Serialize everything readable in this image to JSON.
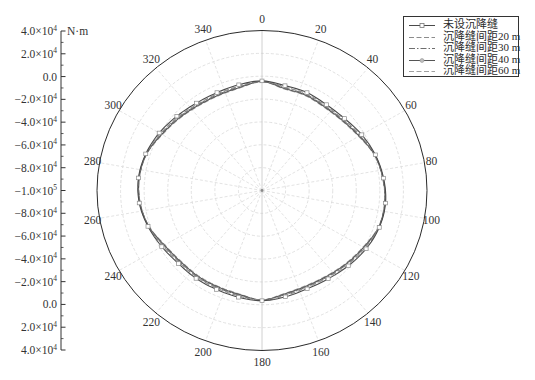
{
  "chart_data": {
    "type": "polar_line",
    "title": "",
    "grid": true,
    "legend_position": "top-right",
    "radial_axis": {
      "label": "N·m",
      "min": -100000,
      "max": 40000,
      "major_step": 20000,
      "tick_labels": [
        {
          "base": "4.0×10",
          "exp": "4"
        },
        {
          "base": "2.0×10",
          "exp": "4"
        },
        {
          "base": "0.0",
          "exp": ""
        },
        {
          "base": "−2.0×10",
          "exp": "4"
        },
        {
          "base": "−4.0×10",
          "exp": "4"
        },
        {
          "base": "−6.0×10",
          "exp": "4"
        },
        {
          "base": "−8.0×10",
          "exp": "4"
        },
        {
          "base": "−1.0×10",
          "exp": "5"
        },
        {
          "base": "−8.0×10",
          "exp": "4"
        },
        {
          "base": "−6.0×10",
          "exp": "4"
        },
        {
          "base": "−4.0×10",
          "exp": "4"
        },
        {
          "base": "−2.0×10",
          "exp": "4"
        },
        {
          "base": "0.0",
          "exp": ""
        },
        {
          "base": "2.0×10",
          "exp": "4"
        },
        {
          "base": "4.0×10",
          "exp": "4"
        }
      ]
    },
    "angular_axis": {
      "zero": "top",
      "direction": "clockwise",
      "tick_labels": [
        "0",
        "20",
        "40",
        "60",
        "80",
        "100",
        "120",
        "140",
        "160",
        "180",
        "200",
        "220",
        "240",
        "260",
        "280",
        "300",
        "320",
        "340"
      ]
    },
    "theta": [
      0,
      12,
      24,
      36,
      48,
      60,
      72,
      84,
      96,
      108,
      120,
      132,
      144,
      156,
      168,
      180,
      192,
      204,
      216,
      228,
      240,
      252,
      264,
      276,
      288,
      300,
      312,
      324,
      336,
      348
    ],
    "series": [
      {
        "name": "未设沉降缝",
        "color": "#4a4a4a",
        "line_style": "solid",
        "marker": "square",
        "values": [
          -4100,
          -6200,
          -6200,
          -7100,
          -5800,
          -2300,
          1100,
          3700,
          5400,
          4600,
          2000,
          -1500,
          -4500,
          -5800,
          -4900,
          -3600,
          -4500,
          -5200,
          -4900,
          -4500,
          -1800,
          1700,
          4700,
          5400,
          3700,
          700,
          -2800,
          -5400,
          -6200,
          -5400
        ]
      },
      {
        "name": "沉降缝间距20 m",
        "color": "#8c8c8c",
        "line_style": "dashed",
        "marker": "none",
        "values": [
          -4400,
          -7400,
          -7400,
          -8300,
          -7000,
          -3500,
          800,
          3400,
          5100,
          4300,
          800,
          -2700,
          -5700,
          -7000,
          -6100,
          -3900,
          -5700,
          -6400,
          -6100,
          -5700,
          -3000,
          1400,
          4400,
          5100,
          3400,
          -500,
          -4000,
          -6600,
          -7400,
          -6600
        ]
      },
      {
        "name": "沉降缝间距30 m",
        "color": "#6e6e6e",
        "line_style": "dash-dot",
        "marker": "none",
        "values": [
          -4600,
          -8100,
          -8100,
          -9000,
          -7700,
          -4200,
          600,
          3200,
          4900,
          4100,
          100,
          -3400,
          -6400,
          -7700,
          -6800,
          -4100,
          -6400,
          -7100,
          -6800,
          -6400,
          -3700,
          1200,
          4200,
          4900,
          3200,
          -1200,
          -4700,
          -7300,
          -8100,
          -7300
        ]
      },
      {
        "name": "沉降缝间距40 m",
        "color": "#555555",
        "line_style": "solid",
        "marker": "circle",
        "values": [
          -4700,
          -8700,
          -8700,
          -9600,
          -8300,
          -4800,
          500,
          3100,
          4800,
          4000,
          -500,
          -4000,
          -7000,
          -8300,
          -7400,
          -4200,
          -7000,
          -7700,
          -7400,
          -7000,
          -4300,
          1100,
          4100,
          4800,
          3100,
          -1800,
          -5300,
          -7900,
          -8700,
          -7900
        ]
      },
      {
        "name": "沉降缝间距60 m",
        "color": "#a0a0a0",
        "line_style": "dashed",
        "marker": "none",
        "values": [
          -4900,
          -9200,
          -9200,
          -10100,
          -8800,
          -5300,
          300,
          2900,
          4600,
          3800,
          -1000,
          -4500,
          -7500,
          -8800,
          -7900,
          -4400,
          -7500,
          -8200,
          -7900,
          -7500,
          -4800,
          900,
          3900,
          4600,
          2900,
          -2300,
          -5800,
          -8400,
          -9200,
          -8400
        ]
      }
    ]
  }
}
